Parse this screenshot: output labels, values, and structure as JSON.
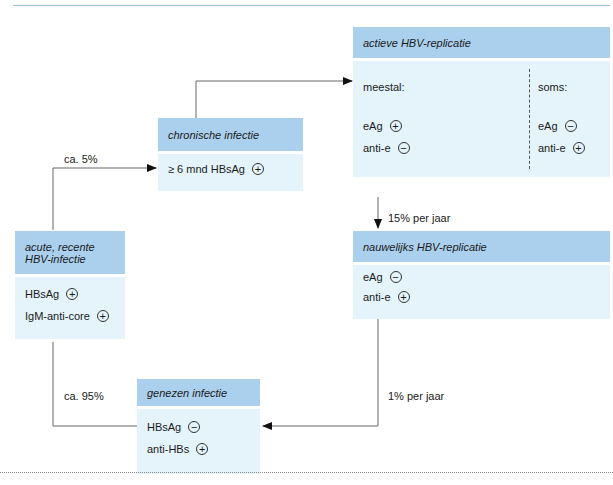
{
  "diagram": {
    "colors": {
      "header": "#abd0ee",
      "body": "#e4f4fa",
      "line": "#555555"
    },
    "nodes": {
      "acute": {
        "title_line1": "acute, recente",
        "title_line2": "HBV-infectie",
        "items": [
          {
            "label": "HBsAg",
            "sign": "+"
          },
          {
            "label": "IgM-anti-core",
            "sign": "+"
          }
        ]
      },
      "chronic": {
        "title": "chronische infectie",
        "items": [
          {
            "label": "≥ 6 mnd HBsAg",
            "sign": "+"
          }
        ]
      },
      "active": {
        "title": "actieve HBV-replicatie",
        "left_heading": "meestal:",
        "right_heading": "soms:",
        "left_items": [
          {
            "label": "eAg",
            "sign": "+"
          },
          {
            "label": "anti-e",
            "sign": "−"
          }
        ],
        "right_items": [
          {
            "label": "eAg",
            "sign": "−"
          },
          {
            "label": "anti-e",
            "sign": "+"
          }
        ]
      },
      "low": {
        "title": "nauwelijks HBV-replicatie",
        "items": [
          {
            "label": "eAg",
            "sign": "−"
          },
          {
            "label": "anti-e",
            "sign": "+"
          }
        ]
      },
      "healed": {
        "title": "genezen infectie",
        "items": [
          {
            "label": "HBsAg",
            "sign": "−"
          },
          {
            "label": "anti-HBs",
            "sign": "+"
          }
        ]
      }
    },
    "edges": {
      "acute_to_chronic": "ca. 5%",
      "acute_to_healed": "ca. 95%",
      "active_to_low": "15% per jaar",
      "low_to_healed": "1% per jaar"
    }
  }
}
